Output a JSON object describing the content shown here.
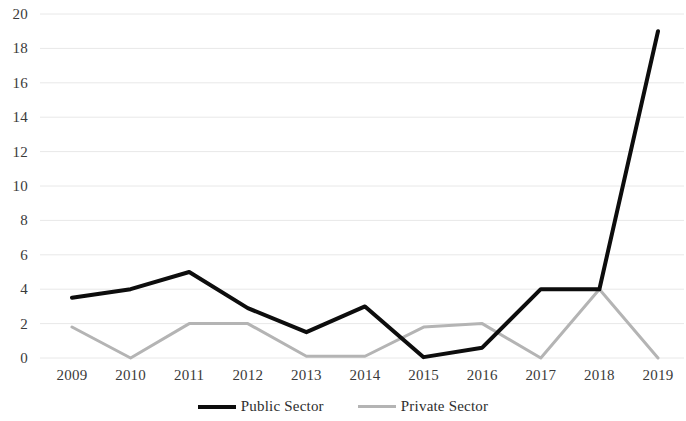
{
  "chart_data": {
    "type": "line",
    "title": "",
    "subtitle": "",
    "xlabel": "",
    "ylabel": "",
    "categories": [
      "2009",
      "2010",
      "2011",
      "2012",
      "2013",
      "2014",
      "2015",
      "2016",
      "2017",
      "2018",
      "2019"
    ],
    "series": [
      {
        "name": "Public Sector",
        "color": "#0d0d0d",
        "line_width": 4,
        "values": [
          3.5,
          4.0,
          5.0,
          2.9,
          1.5,
          3.0,
          0.05,
          0.6,
          4.0,
          4.0,
          19.0
        ]
      },
      {
        "name": "Private Sector",
        "color": "#b4b4b4",
        "line_width": 3,
        "values": [
          1.8,
          0.0,
          2.0,
          2.0,
          0.1,
          0.1,
          1.8,
          2.0,
          0.0,
          4.0,
          0.0
        ]
      }
    ],
    "ylim": [
      0,
      20
    ],
    "ytick_step": 2,
    "yticks": [
      "20",
      "18",
      "16",
      "14",
      "12",
      "10",
      "8",
      "6",
      "4",
      "2",
      "0"
    ],
    "xticks": [
      "2009",
      "2010",
      "2011",
      "2012",
      "2013",
      "2014",
      "2015",
      "2016",
      "2017",
      "2018",
      "2019"
    ],
    "grid": {
      "horizontal": true,
      "vertical": false,
      "color": "#e8e8e8"
    },
    "legend": {
      "position": "bottom",
      "entries": [
        {
          "label": "Public Sector",
          "color": "#0d0d0d",
          "style": "thick-solid"
        },
        {
          "label": "Private Sector",
          "color": "#b4b4b4",
          "style": "thin-solid"
        }
      ]
    },
    "background": "#ffffff"
  }
}
